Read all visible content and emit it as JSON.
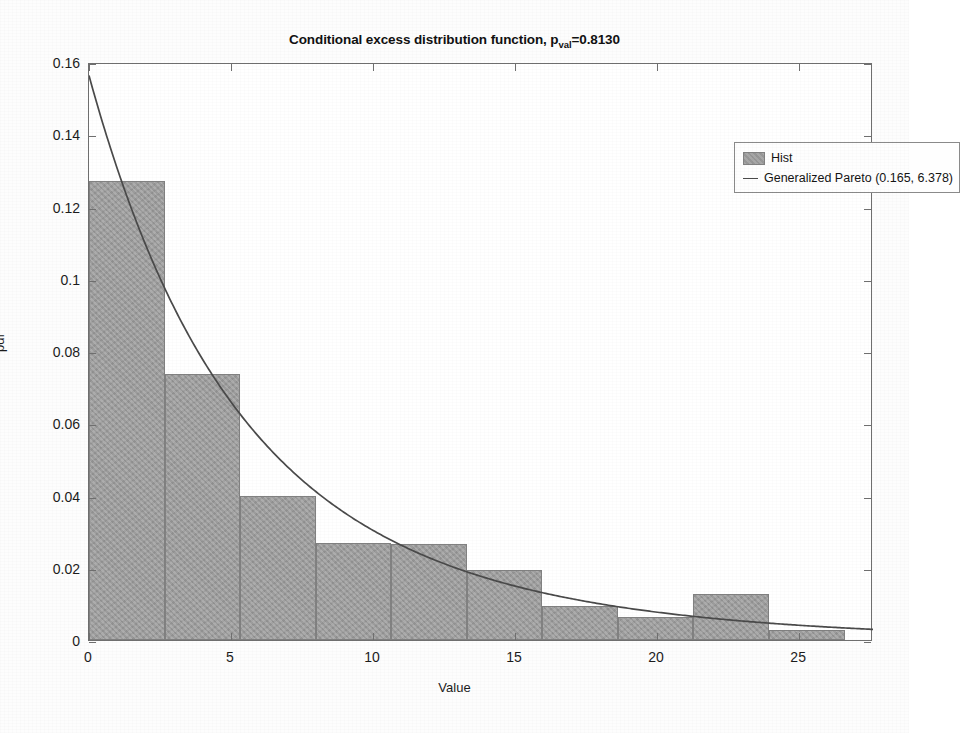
{
  "chart_data": {
    "type": "bar",
    "title_main": "Conditional excess distribution function, p",
    "title_sub": "val",
    "title_tail": "=0.8130",
    "xlabel": "Value",
    "ylabel": "pdf",
    "xlim": [
      0,
      27.6
    ],
    "ylim": [
      0,
      0.16
    ],
    "xticks": [
      0,
      5,
      10,
      15,
      20,
      25
    ],
    "xtick_labels": [
      "0",
      "5",
      "10",
      "15",
      "20",
      "25"
    ],
    "yticks": [
      0,
      0.02,
      0.04,
      0.06,
      0.08,
      0.1,
      0.12,
      0.14,
      0.16
    ],
    "ytick_labels": [
      "0",
      "0.02",
      "0.04",
      "0.06",
      "0.08",
      "0.1",
      "0.12",
      "0.14",
      "0.16"
    ],
    "grid": false,
    "legend_position": "top-right",
    "bin_edges": [
      0,
      2.66,
      5.32,
      7.98,
      10.64,
      13.3,
      15.96,
      18.62,
      21.28,
      23.94,
      26.6
    ],
    "bin_width": 2.66,
    "values": [
      0.127,
      0.0735,
      0.04,
      0.0268,
      0.0265,
      0.0195,
      0.0095,
      0.0065,
      0.0128,
      0.0028
    ],
    "series": [
      {
        "name": "Hist",
        "type": "bar",
        "color": "#9d9d9d",
        "values": [
          0.127,
          0.0735,
          0.04,
          0.0268,
          0.0265,
          0.0195,
          0.0095,
          0.0065,
          0.0128,
          0.0028
        ]
      },
      {
        "name": "Generalized Pareto (0.165, 6.378)",
        "type": "line",
        "color": "#4a4a4a",
        "shape_k": 0.165,
        "scale_sigma": 6.378,
        "x": [
          0,
          1,
          2,
          3,
          4,
          5,
          6,
          7,
          8,
          9,
          10,
          11,
          12,
          13,
          14,
          15,
          16,
          17,
          18,
          19,
          20,
          21,
          22,
          23,
          24,
          25,
          26,
          27.6
        ],
        "y": [
          0.1568,
          0.1429,
          0.1308,
          0.12,
          0.1105,
          0.1021,
          0.0945,
          0.0877,
          0.0816,
          0.0761,
          0.0711,
          0.0665,
          0.0624,
          0.0586,
          0.0551,
          0.0519,
          0.0489,
          0.0462,
          0.0437,
          0.0414,
          0.0392,
          0.0372,
          0.0354,
          0.0336,
          0.032,
          0.0305,
          0.0291,
          0.0271
        ]
      }
    ]
  },
  "legend": {
    "entries": [
      {
        "label": "Hist",
        "marker": "swatch"
      },
      {
        "label": "Generalized Pareto (0.165, 6.378)",
        "marker": "line"
      }
    ]
  },
  "colors": {
    "bar_fill": "#9d9d9d",
    "bar_edge": "#818181",
    "curve": "#4a4a4a",
    "axis": "#6f6f6f",
    "text": "#1c1c1c",
    "background": "#ffffff"
  }
}
